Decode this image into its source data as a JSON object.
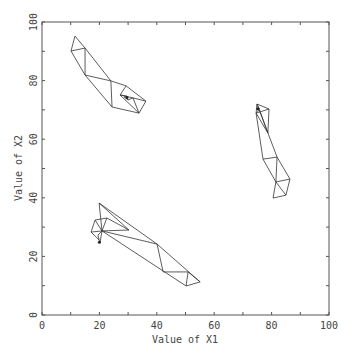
{
  "chart_data": {
    "type": "scatter",
    "title": "",
    "xlabel": "Value of X1",
    "ylabel": "Value of X2",
    "xlim": [
      0,
      100
    ],
    "ylim": [
      0,
      100
    ],
    "grid": false,
    "legend": null,
    "x_ticks": [
      0,
      20,
      40,
      60,
      80,
      100
    ],
    "y_ticks": [
      0,
      20,
      40,
      60,
      80,
      100
    ],
    "x_minor_step": 10,
    "y_minor_step": 10,
    "box": true,
    "series": [
      {
        "name": "cluster-upper-left",
        "points": [
          [
            11.5,
            95.2
          ],
          [
            10.1,
            90.1
          ],
          [
            15.0,
            91.1
          ],
          [
            15.0,
            81.9
          ],
          [
            24.0,
            79.9
          ],
          [
            24.4,
            71.0
          ],
          [
            29.3,
            78.2
          ],
          [
            36.2,
            73.0
          ],
          [
            33.8,
            68.9
          ],
          [
            27.2,
            75.1
          ],
          [
            31.7,
            74.1
          ],
          [
            29.6,
            74.7
          ],
          [
            30.0,
            73.4
          ],
          [
            28.6,
            74.4
          ]
        ],
        "edges": [
          [
            0,
            1
          ],
          [
            0,
            2
          ],
          [
            1,
            2
          ],
          [
            1,
            3
          ],
          [
            2,
            3
          ],
          [
            2,
            4
          ],
          [
            3,
            4
          ],
          [
            3,
            5
          ],
          [
            4,
            5
          ],
          [
            5,
            8
          ],
          [
            4,
            6
          ],
          [
            6,
            7
          ],
          [
            7,
            8
          ],
          [
            6,
            9
          ],
          [
            9,
            8
          ],
          [
            9,
            10
          ],
          [
            10,
            7
          ],
          [
            10,
            8
          ],
          [
            11,
            12
          ],
          [
            11,
            13
          ],
          [
            12,
            13
          ],
          [
            9,
            11
          ],
          [
            10,
            12
          ]
        ]
      },
      {
        "name": "cluster-right",
        "points": [
          [
            74.9,
            72.0
          ],
          [
            74.6,
            68.9
          ],
          [
            79.1,
            70.3
          ],
          [
            78.7,
            62.1
          ],
          [
            77.0,
            53.2
          ],
          [
            81.9,
            53.9
          ],
          [
            81.5,
            45.4
          ],
          [
            86.4,
            46.4
          ],
          [
            85.0,
            40.9
          ],
          [
            80.5,
            39.9
          ],
          [
            75.6,
            70.6
          ],
          [
            75.3,
            69.6
          ]
        ],
        "edges": [
          [
            0,
            1
          ],
          [
            0,
            2
          ],
          [
            1,
            2
          ],
          [
            2,
            3
          ],
          [
            1,
            3
          ],
          [
            1,
            4
          ],
          [
            0,
            5
          ],
          [
            4,
            5
          ],
          [
            4,
            6
          ],
          [
            5,
            6
          ],
          [
            5,
            7
          ],
          [
            6,
            7
          ],
          [
            6,
            8
          ],
          [
            7,
            8
          ],
          [
            8,
            9
          ],
          [
            6,
            9
          ],
          [
            10,
            11
          ],
          [
            10,
            0
          ],
          [
            11,
            1
          ],
          [
            10,
            3
          ]
        ]
      },
      {
        "name": "cluster-lower-left",
        "points": [
          [
            19.9,
            38.2
          ],
          [
            18.5,
            32.4
          ],
          [
            17.1,
            28.3
          ],
          [
            20.9,
            28.7
          ],
          [
            22.6,
            33.1
          ],
          [
            30.3,
            29.0
          ],
          [
            40.1,
            24.2
          ],
          [
            42.2,
            14.7
          ],
          [
            50.9,
            14.7
          ],
          [
            55.1,
            11.3
          ],
          [
            50.2,
            9.9
          ],
          [
            19.9,
            25.6
          ],
          [
            20.2,
            24.6
          ],
          [
            19.5,
            27.3
          ]
        ],
        "edges": [
          [
            0,
            3
          ],
          [
            0,
            5
          ],
          [
            0,
            6
          ],
          [
            1,
            2
          ],
          [
            1,
            3
          ],
          [
            1,
            4
          ],
          [
            2,
            3
          ],
          [
            3,
            4
          ],
          [
            4,
            5
          ],
          [
            3,
            5
          ],
          [
            3,
            6
          ],
          [
            6,
            7
          ],
          [
            6,
            9
          ],
          [
            7,
            8
          ],
          [
            8,
            9
          ],
          [
            9,
            10
          ],
          [
            8,
            10
          ],
          [
            3,
            10
          ],
          [
            2,
            11
          ],
          [
            11,
            12
          ],
          [
            11,
            13
          ],
          [
            12,
            3
          ],
          [
            13,
            3
          ]
        ]
      }
    ]
  }
}
